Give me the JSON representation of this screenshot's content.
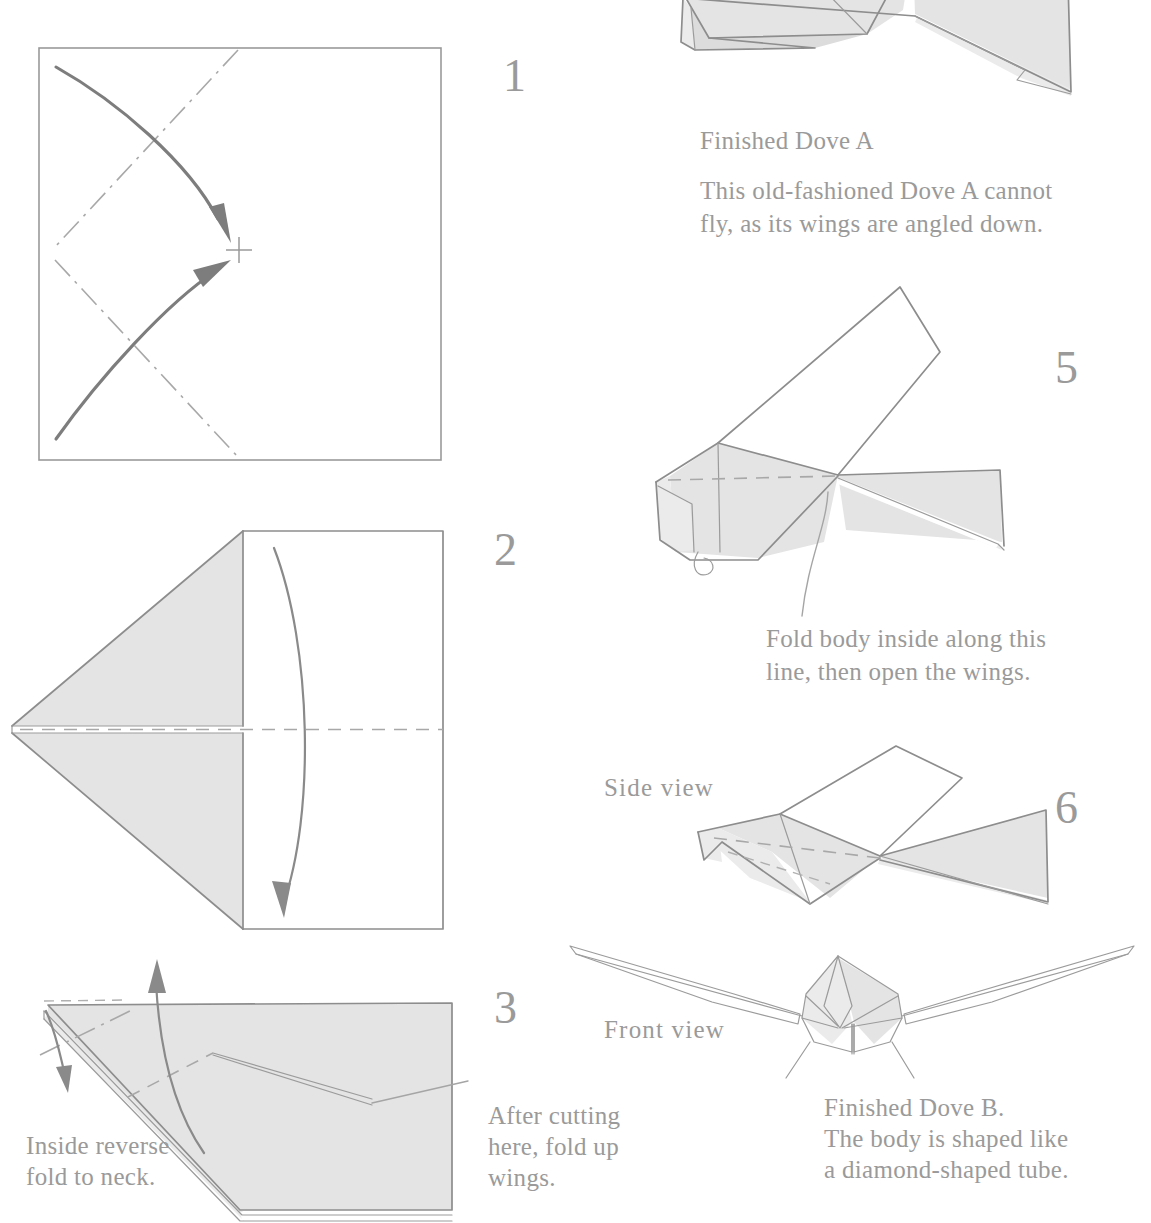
{
  "document": {
    "title": "Origami Dove folding instructions",
    "ink_color": "#9a9a9a",
    "paper_fill": "#e4e4e4"
  },
  "steps": [
    {
      "id": "step-1",
      "number": "1"
    },
    {
      "id": "step-2",
      "number": "2"
    },
    {
      "id": "step-3",
      "number": "3"
    },
    {
      "id": "step-5",
      "number": "5"
    },
    {
      "id": "step-6",
      "number": "6"
    }
  ],
  "annotations": {
    "finished_dove_a_title": "Finished Dove A",
    "finished_dove_a_body": "This old-fashioned Dove A cannot\nfly, as its wings are angled down.",
    "fold_body_note": "Fold body inside along this\nline, then open the wings.",
    "side_view": "Side view",
    "front_view": "Front view",
    "finished_dove_b": "Finished Dove B.\nThe body is shaped like\na diamond-shaped tube.",
    "inside_reverse": "Inside reverse\n  fold to neck.",
    "after_cutting": "After cutting\nhere, fold up\nwings."
  },
  "diagram_details": {
    "step1_square": "Square sheet with diagonal valley crease marks and two curved fold arrows meeting at a cross reference mark",
    "step1_cross_mark": "+",
    "step2_shape": "Kite/triangle flap folded to the left, horizontal center dashed crease, curved arrow folding top half down",
    "step3_shape": "Folded triangle with mountain dash-dot crease at neck, up arrow for wings, small down arrow for inside reverse fold",
    "step5_shape": "Three-dimensional dove with raised wing, dashed body crease and curl arrow",
    "step6_shape": "Side view of finished dove with open wings",
    "front_shape": "Front view of finished dove with diamond-shaped body tube"
  }
}
